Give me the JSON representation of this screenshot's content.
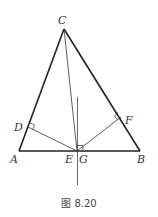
{
  "figure": {
    "caption": "图 8.20",
    "labels": {
      "A": "A",
      "B": "B",
      "C": "C",
      "D": "D",
      "E": "E",
      "F": "F",
      "G": "G"
    },
    "segments": [
      {
        "name": "AB",
        "kind": "triangle-side"
      },
      {
        "name": "AC",
        "kind": "triangle-side"
      },
      {
        "name": "BC",
        "kind": "triangle-side"
      },
      {
        "name": "CE",
        "kind": "cevian"
      },
      {
        "name": "DE",
        "kind": "perpendicular-to-AC"
      },
      {
        "name": "EF",
        "kind": "perpendicular-to-BC"
      },
      {
        "name": "perpendicular-at-G",
        "kind": "perpendicular-to-AB"
      }
    ],
    "right_angles": [
      "D",
      "F",
      "G"
    ],
    "colors": {
      "stroke": "#222222",
      "label": "#333333"
    }
  }
}
